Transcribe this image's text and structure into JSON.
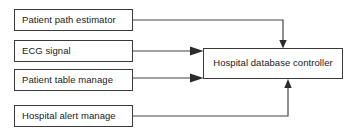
{
  "diagram": {
    "type": "block-flow",
    "style": {
      "background": "#ffffff",
      "box_border_color": "#3a3a3a",
      "box_fill_color": "#ffffff",
      "connector_color": "#444444",
      "text_color": "#1a1a1a"
    },
    "nodes": [
      {
        "id": "patient-path-estimator",
        "label": "Patient path estimator",
        "role": "source",
        "x": 14,
        "y": 9,
        "width": 119,
        "height": 22
      },
      {
        "id": "ecg-signal",
        "label": "ECG signal",
        "role": "source",
        "x": 14,
        "y": 40,
        "width": 119,
        "height": 22
      },
      {
        "id": "patient-table-manage",
        "label": "Patient table manage",
        "role": "source",
        "x": 14,
        "y": 69,
        "width": 119,
        "height": 22
      },
      {
        "id": "hospital-alert-manage",
        "label": "Hospital alert manage",
        "role": "source",
        "x": 14,
        "y": 105,
        "width": 119,
        "height": 22
      },
      {
        "id": "hospital-database-controller",
        "label": "Hospital database controller",
        "role": "sink",
        "x": 203,
        "y": 48,
        "width": 140,
        "height": 31
      }
    ],
    "connectors": [
      {
        "id": "patient-path-estimator-to-controller",
        "from": "patient-path-estimator",
        "to": "hospital-database-controller",
        "path": "M 133 20 L 283 20 L 283 44",
        "arrow_direction": "down",
        "arrow_tip_x": 283,
        "arrow_tip_y": 48
      },
      {
        "id": "ecg-signal-to-controller",
        "from": "ecg-signal",
        "to": "hospital-database-controller",
        "path": "M 133 51 L 199 51",
        "arrow_direction": "right",
        "arrow_tip_x": 203,
        "arrow_tip_y": 51
      },
      {
        "id": "patient-table-manage-to-controller",
        "from": "patient-table-manage",
        "to": "hospital-database-controller",
        "path": "M 133 78 L 199 78",
        "arrow_direction": "right",
        "arrow_tip_x": 203,
        "arrow_tip_y": 78
      },
      {
        "id": "hospital-alert-manage-to-controller",
        "from": "hospital-alert-manage",
        "to": "hospital-database-controller",
        "path": "M 133 116 L 288 116 L 288 84",
        "arrow_direction": "up",
        "arrow_tip_x": 288,
        "arrow_tip_y": 79
      }
    ]
  }
}
